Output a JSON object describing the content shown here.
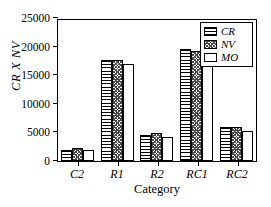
{
  "chart_data": {
    "type": "bar",
    "title": "",
    "subtitle": "",
    "xlabel": "Category",
    "ylabel": "CR  X  NV",
    "categories": [
      "C2",
      "R1",
      "R2",
      "RC1",
      "RC2"
    ],
    "series": [
      {
        "name": "CR",
        "pattern": "horizontal-lines",
        "values": [
          1900,
          17700,
          4500,
          19600,
          5900
        ]
      },
      {
        "name": "NV",
        "pattern": "cross-hatch",
        "values": [
          2300,
          17600,
          4900,
          19300,
          5900
        ]
      },
      {
        "name": "MO",
        "pattern": "solid-white",
        "values": [
          2000,
          17000,
          4200,
          19200,
          5300
        ]
      }
    ],
    "ylim": [
      0,
      25000
    ],
    "ytick_values": [
      0,
      5000,
      10000,
      15000,
      20000,
      25000
    ],
    "ytick_labels": [
      "0",
      "5000",
      "10000",
      "15000",
      "20000",
      "25000"
    ],
    "grid": false,
    "legend_position": "top-right",
    "legend_entries": [
      "CR",
      "NV",
      "MO"
    ],
    "annotations": []
  },
  "colors": {
    "axis": "#000000",
    "background": "#ffffff",
    "bar_edge": "#000000",
    "hatch": "#000000"
  }
}
